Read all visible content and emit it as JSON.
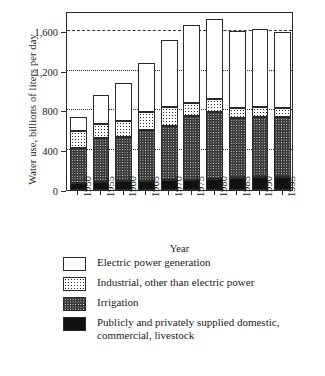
{
  "chart_data": {
    "type": "bar",
    "stacked": true,
    "title": "",
    "xlabel": "Year",
    "ylabel": "Water use, billions of liters per day",
    "categories": [
      "1950",
      "1955",
      "1960",
      "1965",
      "1970",
      "1975",
      "1980",
      "1985",
      "1990",
      "1995"
    ],
    "ylim": [
      0,
      1800
    ],
    "yticks": [
      0,
      400,
      800,
      1200,
      1600
    ],
    "ytick_labels": [
      "0",
      "400",
      "800",
      "1,200",
      "1,600"
    ],
    "grid": true,
    "legend_position": "below",
    "series": [
      {
        "name": "Publicly and privately supplied domestic, commercial, livestock",
        "fill": "solid-black",
        "values": [
          75,
          85,
          90,
          95,
          100,
          105,
          115,
          120,
          130,
          135
        ]
      },
      {
        "name": "Irrigation",
        "fill": "dark-dotted",
        "values": [
          345,
          435,
          440,
          505,
          545,
          640,
          665,
          605,
          600,
          595
        ]
      },
      {
        "name": "Industrial, other than electric power",
        "fill": "light-dotted",
        "values": [
          170,
          145,
          165,
          185,
          185,
          135,
          140,
          100,
          100,
          95
        ]
      },
      {
        "name": "Electric power generation",
        "fill": "white",
        "values": [
          145,
          290,
          385,
          490,
          680,
          775,
          800,
          770,
          785,
          760
        ]
      }
    ],
    "totals": [
      735,
      955,
      1080,
      1275,
      1510,
      1655,
      1720,
      1595,
      1615,
      1585
    ]
  },
  "axis": {
    "y_title": "Water use, billions of liters per day",
    "x_title": "Year",
    "y_tick_labels": [
      "1,600",
      "1,200",
      "800",
      "400",
      "0"
    ]
  },
  "legend": {
    "items": [
      {
        "label": "Electric power generation",
        "swatch": "white"
      },
      {
        "label": "Industrial, other than electric power",
        "swatch": "light-dotted"
      },
      {
        "label": "Irrigation",
        "swatch": "dark-dotted"
      },
      {
        "label": "Publicly and privately supplied domestic,\ncommercial, livestock",
        "swatch": "solid-black"
      }
    ]
  }
}
